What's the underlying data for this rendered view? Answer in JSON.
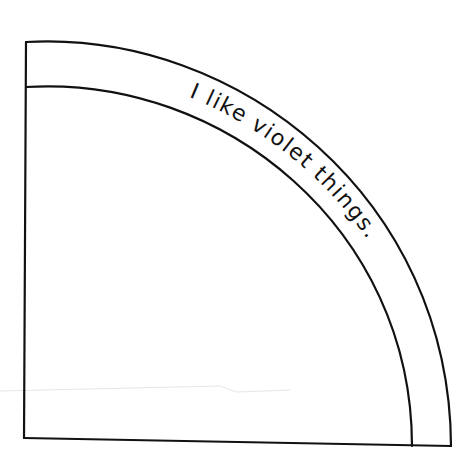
{
  "figure": {
    "type": "quarter-circle band worksheet",
    "band_text": "I like violet things.",
    "colors": {
      "background": "#ffffff",
      "ink": "#111111"
    }
  }
}
